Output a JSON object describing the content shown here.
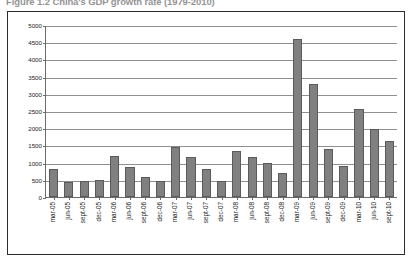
{
  "figure": {
    "title": "Figure 1.2 China's GDP growth rate (1979-2010)"
  },
  "chart_data": {
    "type": "bar",
    "title": "Figure 1.2 China's GDP growth rate (1979-2010)",
    "xlabel": "",
    "ylabel": "",
    "ylim": [
      0,
      5000
    ],
    "ytick_step": 500,
    "grid": true,
    "legend": false,
    "bar_color": "#808080",
    "bar_border_color": "#5a5a5a",
    "yticks": [
      "0",
      "500",
      "1000",
      "1500",
      "2000",
      "2500",
      "3000",
      "3500",
      "4000",
      "4500",
      "5000"
    ],
    "categories": [
      "mar-05",
      "jun-05",
      "sept-05",
      "dec-05",
      "mar-06",
      "jun-06",
      "sept-06",
      "dec-06",
      "mar-07",
      "jun-07",
      "sept-07",
      "dec-07",
      "mar-08",
      "jun-08",
      "sept-08",
      "dec-08",
      "mar-09",
      "jun-09",
      "sept-09",
      "dec-09",
      "mar-10",
      "jun-10",
      "sept-10"
    ],
    "values": [
      800,
      450,
      470,
      490,
      1190,
      860,
      590,
      480,
      1440,
      1150,
      800,
      480,
      1340,
      1150,
      990,
      700,
      4580,
      3280,
      1390,
      890,
      2570,
      1980,
      1620
    ]
  }
}
